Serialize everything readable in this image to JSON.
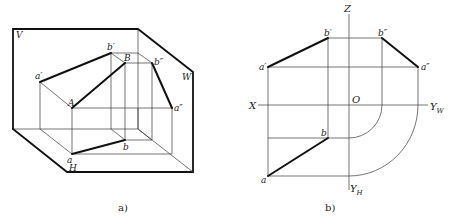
{
  "figure_a": {
    "caption": "a)",
    "planes": {
      "V": "V",
      "W": "W",
      "H": "H"
    },
    "points": {
      "a_prime": "a′",
      "b_prime": "b′",
      "B": "B",
      "b_double_prime": "b″",
      "a_double_prime": "a″",
      "A": "A",
      "a": "a",
      "b": "b"
    }
  },
  "figure_b": {
    "caption": "b)",
    "axes": {
      "Z": "Z",
      "X": "X",
      "O": "O",
      "YW": "Y",
      "YW_sub": "W",
      "YH": "Y",
      "YH_sub": "H"
    },
    "points": {
      "a_prime": "a′",
      "b_prime": "b′",
      "b_double_prime": "b″",
      "a_double_prime": "a″",
      "a": "a",
      "b": "b"
    }
  }
}
